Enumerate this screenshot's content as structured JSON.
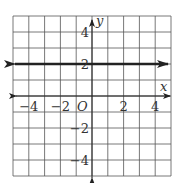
{
  "chart_data": {
    "type": "line",
    "title": "",
    "xlabel": "x",
    "ylabel": "y",
    "xlim": [
      -5,
      5
    ],
    "ylim": [
      -5,
      5
    ],
    "grid": true,
    "grid_step": 1,
    "origin_label": "O",
    "x_tick_labels": [
      {
        "value": -4,
        "text": "−4"
      },
      {
        "value": -2,
        "text": "−2"
      },
      {
        "value": 2,
        "text": "2"
      },
      {
        "value": 4,
        "text": "4"
      }
    ],
    "y_tick_labels": [
      {
        "value": 4,
        "text": "4"
      },
      {
        "value": 2,
        "text": "2"
      },
      {
        "value": -2,
        "text": "−2"
      },
      {
        "value": -4,
        "text": "−4"
      }
    ],
    "series": [
      {
        "name": "y = 2",
        "equation": "y = 2",
        "x": [
          -5,
          5
        ],
        "y": [
          2,
          2
        ],
        "arrows": "both",
        "color": "#222222"
      }
    ],
    "colors": {
      "grid": "#555555",
      "axis": "#222222",
      "line": "#222222",
      "background": "#ffffff"
    }
  }
}
